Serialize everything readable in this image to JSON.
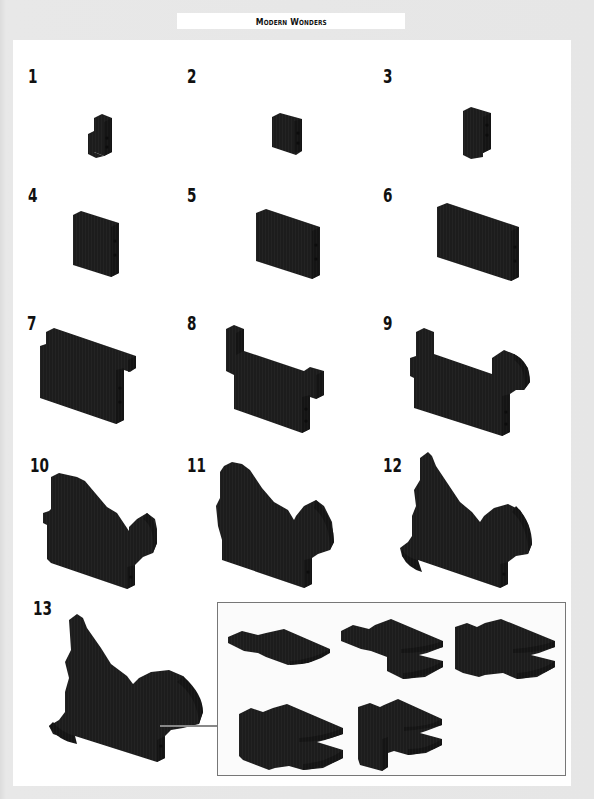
{
  "header": {
    "title": "Modern Wonders"
  },
  "colors": {
    "background": "#e4e4e4",
    "page": "#ffffff",
    "brick": "#1c1c1c",
    "brick_shade": "#111111",
    "brick_highlight": "#2a2a2a",
    "callout_border": "#777777"
  },
  "steps": [
    {
      "number": "1",
      "icon": "brick-build-step-1"
    },
    {
      "number": "2",
      "icon": "brick-build-step-2"
    },
    {
      "number": "3",
      "icon": "brick-build-step-3"
    },
    {
      "number": "4",
      "icon": "brick-build-step-4"
    },
    {
      "number": "5",
      "icon": "brick-build-step-5"
    },
    {
      "number": "6",
      "icon": "brick-build-step-6"
    },
    {
      "number": "7",
      "icon": "brick-build-step-7"
    },
    {
      "number": "8",
      "icon": "brick-build-step-8"
    },
    {
      "number": "9",
      "icon": "brick-build-step-9"
    },
    {
      "number": "10",
      "icon": "brick-build-step-10"
    },
    {
      "number": "11",
      "icon": "brick-build-step-11"
    },
    {
      "number": "12",
      "icon": "brick-build-step-12"
    },
    {
      "number": "13",
      "icon": "brick-build-step-13"
    }
  ],
  "callout": {
    "substeps": [
      {
        "icon": "sub-assembly-1"
      },
      {
        "icon": "sub-assembly-2"
      },
      {
        "icon": "sub-assembly-3"
      },
      {
        "icon": "sub-assembly-4"
      },
      {
        "icon": "sub-assembly-5"
      }
    ]
  }
}
